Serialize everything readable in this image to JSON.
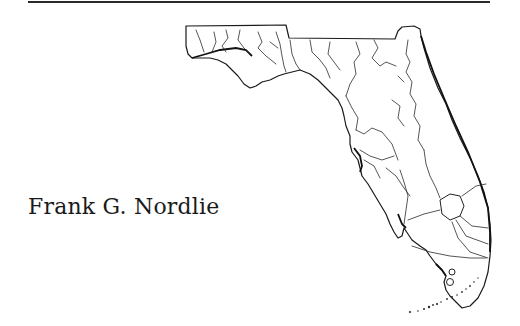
{
  "page": {
    "author_name": "Frank G. Nordlie",
    "illustration": "map-of-florida-with-rivers",
    "colors": {
      "ink": "#1a1a1a",
      "background": "#ffffff"
    }
  }
}
